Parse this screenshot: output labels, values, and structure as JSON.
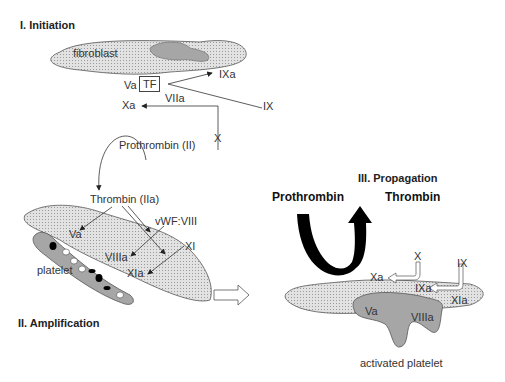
{
  "sections": {
    "initiation": {
      "title": "I. Initiation",
      "cell": "fibroblast",
      "labels": {
        "va": "Va",
        "tf": "TF",
        "ixa": "IXa",
        "ix": "IX",
        "viia": "VIIa",
        "xa": "Xa",
        "x": "X",
        "prothrombin": "Prothrombin (II)"
      }
    },
    "amplification": {
      "title": "II. Amplification",
      "cell": "platelet",
      "labels": {
        "thrombin": "Thrombin (IIa)",
        "vwf": "vWF:VIII",
        "va": "Va",
        "xi": "XI",
        "viiia": "VIIIa",
        "xia": "XIa"
      }
    },
    "propagation": {
      "title": "III. Propagation",
      "cell": "activated platelet",
      "labels": {
        "prothrombin": "Prothrombin",
        "thrombin": "Thrombin",
        "x": "X",
        "xa": "Xa",
        "ix": "IX",
        "ixa": "IXa",
        "xia": "XIa",
        "va": "Va",
        "viiia": "VIIIa"
      }
    }
  },
  "colors": {
    "stipple": "#d9d9d9",
    "dark_cell": "#a6a6a6",
    "outline": "#555555",
    "arrow": "#333333",
    "big_arrow": "#000000"
  }
}
